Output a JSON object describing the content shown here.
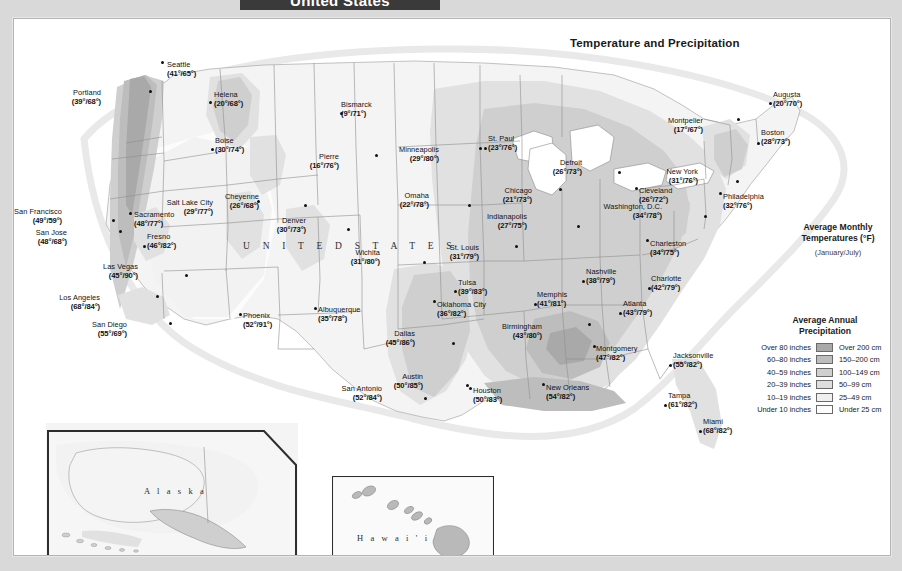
{
  "banner": {
    "title": "United States"
  },
  "map": {
    "subtitle": "Temperature and Precipitation",
    "country_label": "U N I T E D    S T A T E S",
    "alaska_label": "A l a s k a",
    "hawaii_label": "H a w a i ' i"
  },
  "legend_temperature": {
    "line1": "Average Monthly",
    "line2": "Temperatures (°F)",
    "line3": "(January/July)"
  },
  "legend_precipitation": {
    "title_line1": "Average Annual",
    "title_line2": "Precipitation",
    "rows": [
      {
        "inches": "Over 80 inches",
        "cm": "Over 200 cm",
        "color": "#a9a9a9"
      },
      {
        "inches": "60–80 inches",
        "cm": "150–200 cm",
        "color": "#bdbdbd"
      },
      {
        "inches": "40–59 inches",
        "cm": "100–149 cm",
        "color": "#cfcfcf"
      },
      {
        "inches": "20–39 inches",
        "cm": "50–99 cm",
        "color": "#dedede"
      },
      {
        "inches": "10–19 inches",
        "cm": "25–49 cm",
        "color": "#f0f0f0"
      },
      {
        "inches": "Under 10 inches",
        "cm": "Under 25 cm",
        "color": "#fdfdfd"
      }
    ]
  },
  "cities": [
    {
      "name": "Seattle",
      "temps": "(41°/65°)",
      "x": 166,
      "y": 60,
      "dx": 160,
      "dy": 60,
      "align": "left"
    },
    {
      "name": "Portland",
      "temps": "(39°/68°)",
      "x": 100,
      "y": 88,
      "dx": 148,
      "dy": 89,
      "align": "right"
    },
    {
      "name": "Helena",
      "temps": "(20°/68°)",
      "x": 213,
      "y": 90,
      "dx": 208,
      "dy": 100,
      "align": "left"
    },
    {
      "name": "Boise",
      "temps": "(30°/74°)",
      "x": 214,
      "y": 136,
      "dx": 210,
      "dy": 147,
      "align": "left"
    },
    {
      "name": "Bismarck",
      "temps": "(9°/71°)",
      "x": 340,
      "y": 100,
      "dx": 339,
      "dy": 111,
      "align": "left"
    },
    {
      "name": "Pierre",
      "temps": "(16°/76°)",
      "x": 338,
      "y": 152,
      "dx": 374,
      "dy": 153,
      "align": "right"
    },
    {
      "name": "Minneapolis",
      "temps": "(29°/80°)",
      "x": 438,
      "y": 145,
      "dx": 478,
      "dy": 146,
      "align": "right"
    },
    {
      "name": "St. Paul",
      "temps": "(23°/76°)",
      "x": 487,
      "y": 134,
      "dx": 483,
      "dy": 146,
      "align": "left"
    },
    {
      "name": "Cheyenne",
      "temps": "(26°/68°)",
      "x": 258,
      "y": 192,
      "dx": 303,
      "dy": 203,
      "align": "right"
    },
    {
      "name": "Denver",
      "temps": "(30°/73°)",
      "x": 305,
      "y": 216,
      "dx": 346,
      "dy": 227,
      "align": "right"
    },
    {
      "name": "Salt Lake City",
      "temps": "(29°/77°)",
      "x": 212,
      "y": 198,
      "dx": 256,
      "dy": 199,
      "align": "right"
    },
    {
      "name": "San Francisco",
      "temps": "(49°/59°)",
      "x": 61,
      "y": 207,
      "dx": 111,
      "dy": 218,
      "align": "right"
    },
    {
      "name": "Sacramento",
      "temps": "(48°/77°)",
      "x": 133,
      "y": 210,
      "dx": 128,
      "dy": 211,
      "align": "left"
    },
    {
      "name": "San Jose",
      "temps": "(48°/68°)",
      "x": 66,
      "y": 228,
      "dx": 118,
      "dy": 229,
      "align": "right"
    },
    {
      "name": "Fresno",
      "temps": "(46°/82°)",
      "x": 146,
      "y": 232,
      "dx": 142,
      "dy": 244,
      "align": "left"
    },
    {
      "name": "Las Vegas",
      "temps": "(45°/90°)",
      "x": 137,
      "y": 262,
      "dx": 184,
      "dy": 273,
      "align": "right"
    },
    {
      "name": "Los Angeles",
      "temps": "(68°/84°)",
      "x": 99,
      "y": 293,
      "dx": 155,
      "dy": 294,
      "align": "right"
    },
    {
      "name": "San Diego",
      "temps": "(55°/69°)",
      "x": 126,
      "y": 320,
      "dx": 168,
      "dy": 321,
      "align": "right"
    },
    {
      "name": "Phoenix",
      "temps": "(52°/91°)",
      "x": 242,
      "y": 311,
      "dx": 238,
      "dy": 312,
      "align": "left"
    },
    {
      "name": "Albuquerque",
      "temps": "(35°/78°)",
      "x": 317,
      "y": 305,
      "dx": 313,
      "dy": 306,
      "align": "left"
    },
    {
      "name": "Omaha",
      "temps": "(22°/78°)",
      "x": 428,
      "y": 191,
      "dx": 467,
      "dy": 203,
      "align": "right"
    },
    {
      "name": "Wichita",
      "temps": "(31°/80°)",
      "x": 379,
      "y": 248,
      "dx": 422,
      "dy": 260,
      "align": "right"
    },
    {
      "name": "Tulsa",
      "temps": "(39°/83°)",
      "x": 457,
      "y": 278,
      "dx": 453,
      "dy": 289,
      "align": "left"
    },
    {
      "name": "Oklahoma City",
      "temps": "(36°/82°)",
      "x": 436,
      "y": 300,
      "dx": 432,
      "dy": 299,
      "align": "left"
    },
    {
      "name": "Dallas",
      "temps": "(45°/86°)",
      "x": 414,
      "y": 329,
      "dx": 451,
      "dy": 341,
      "align": "right"
    },
    {
      "name": "Austin",
      "temps": "(50°/85°)",
      "x": 422,
      "y": 372,
      "dx": 465,
      "dy": 383,
      "align": "right"
    },
    {
      "name": "San Antonio",
      "temps": "(52°/84°)",
      "x": 381,
      "y": 384,
      "dx": 423,
      "dy": 396,
      "align": "right"
    },
    {
      "name": "Houston",
      "temps": "(50°/83°)",
      "x": 472,
      "y": 386,
      "dx": 468,
      "dy": 386,
      "align": "left"
    },
    {
      "name": "Chicago",
      "temps": "(21°/73°)",
      "x": 531,
      "y": 186,
      "dx": 558,
      "dy": 187,
      "align": "right"
    },
    {
      "name": "Indianapolis",
      "temps": "(27°/75°)",
      "x": 526,
      "y": 212,
      "dx": 576,
      "dy": 224,
      "align": "right"
    },
    {
      "name": "St. Louis",
      "temps": "(31°/79°)",
      "x": 478,
      "y": 243,
      "dx": 514,
      "dy": 244,
      "align": "right"
    },
    {
      "name": "Memphis",
      "temps": "(41°/81°)",
      "x": 536,
      "y": 290,
      "dx": 533,
      "dy": 302,
      "align": "left"
    },
    {
      "name": "Nashville",
      "temps": "(38°/79°)",
      "x": 585,
      "y": 267,
      "dx": 581,
      "dy": 279,
      "align": "left"
    },
    {
      "name": "Birmingham",
      "temps": "(43°/80°)",
      "x": 541,
      "y": 322,
      "dx": 587,
      "dy": 322,
      "align": "right"
    },
    {
      "name": "Montgomery",
      "temps": "(47°/82°)",
      "x": 595,
      "y": 344,
      "dx": 592,
      "dy": 344,
      "align": "left"
    },
    {
      "name": "Atlanta",
      "temps": "(43°/79°)",
      "x": 622,
      "y": 299,
      "dx": 618,
      "dy": 311,
      "align": "left"
    },
    {
      "name": "Jacksonville",
      "temps": "(55°/82°)",
      "x": 672,
      "y": 351,
      "dx": 668,
      "dy": 363,
      "align": "left"
    },
    {
      "name": "Tampa",
      "temps": "(61°/82°)",
      "x": 667,
      "y": 391,
      "dx": 663,
      "dy": 403,
      "align": "left"
    },
    {
      "name": "Miami",
      "temps": "(68°/82°)",
      "x": 702,
      "y": 417,
      "dx": 698,
      "dy": 429,
      "align": "left"
    },
    {
      "name": "New Orleans",
      "temps": "(54°/82°)",
      "x": 545,
      "y": 383,
      "dx": 541,
      "dy": 382,
      "align": "left"
    },
    {
      "name": "Charlotte",
      "temps": "(42°/79°)",
      "x": 650,
      "y": 274,
      "dx": 647,
      "dy": 286,
      "align": "left"
    },
    {
      "name": "Charleston",
      "temps": "(34°/75°)",
      "x": 649,
      "y": 239,
      "dx": 645,
      "dy": 238,
      "align": "left"
    },
    {
      "name": "Detroit",
      "temps": "(26°/73°)",
      "x": 581,
      "y": 158,
      "dx": 617,
      "dy": 170,
      "align": "right"
    },
    {
      "name": "Cleveland",
      "temps": "(26°/72°)",
      "x": 638,
      "y": 186,
      "dx": 634,
      "dy": 186,
      "align": "left"
    },
    {
      "name": "Washington, D.C.",
      "temps": "(34°/78°)",
      "x": 661,
      "y": 202,
      "dx": 703,
      "dy": 214,
      "align": "right"
    },
    {
      "name": "New York",
      "temps": "(31°/76°)",
      "x": 697,
      "y": 167,
      "dx": 735,
      "dy": 179,
      "align": "right"
    },
    {
      "name": "Philadelphia",
      "temps": "(32°/76°)",
      "x": 722,
      "y": 192,
      "dx": 718,
      "dy": 191,
      "align": "left"
    },
    {
      "name": "Boston",
      "temps": "(28°/73°)",
      "x": 760,
      "y": 128,
      "dx": 756,
      "dy": 141,
      "align": "left"
    },
    {
      "name": "Montpelier",
      "temps": "(17°/67°)",
      "x": 702,
      "y": 116,
      "dx": 736,
      "dy": 117,
      "align": "right"
    },
    {
      "name": "Augusta",
      "temps": "(20°/70°)",
      "x": 772,
      "y": 90,
      "dx": 768,
      "dy": 101,
      "align": "left"
    }
  ],
  "inset_cities": [
    {
      "name": "Fairbanks",
      "temps": "(-10°/61°)",
      "x": 180,
      "y": 450,
      "dx": 221,
      "dy": 469,
      "align": "left"
    },
    {
      "name": "Anchorage",
      "temps": "(14°/58°)",
      "x": 146,
      "y": 483,
      "dx": 212,
      "dy": 497,
      "align": "left"
    },
    {
      "name": "Juneau",
      "temps": "(28°/57°)",
      "x": 228,
      "y": 512,
      "dx": 266,
      "dy": 513,
      "align": "left"
    },
    {
      "name": "Honolulu",
      "temps": "(72°/79°)",
      "x": 341,
      "y": 485,
      "dx": 375,
      "dy": 486,
      "align": "left"
    },
    {
      "name": "Hilo",
      "temps": "(71°/75°)",
      "x": 403,
      "y": 517,
      "dx": 428,
      "dy": 516,
      "align": "left"
    }
  ]
}
